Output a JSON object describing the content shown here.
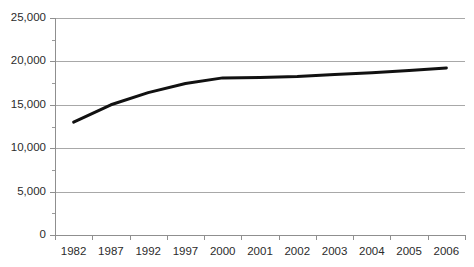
{
  "chart_data": {
    "type": "line",
    "title": "",
    "subtitle": "",
    "xlabel": "",
    "ylabel": "",
    "categories": [
      "1982",
      "1987",
      "1992",
      "1997",
      "2000",
      "2001",
      "2002",
      "2003",
      "2004",
      "2005",
      "2006"
    ],
    "series": [
      {
        "name": "",
        "values": [
          13000,
          15000,
          16400,
          17450,
          18100,
          18150,
          18250,
          18500,
          18700,
          18950,
          19250
        ]
      }
    ],
    "ylim": [
      0,
      25000
    ],
    "y_ticks": [
      0,
      5000,
      10000,
      15000,
      20000,
      25000
    ],
    "y_tick_labels": [
      "0",
      "5,000",
      "10,000",
      "15,000",
      "20,000",
      "25,000"
    ],
    "y_minor_tick_step": 2500,
    "grid": true,
    "grid_axis": "y",
    "legend": false,
    "legend_position": "none",
    "colors": {
      "series_line": "#111111",
      "gridline": "#a8a8a8",
      "axis": "#8f8f8f",
      "text": "#2b2b2b",
      "background": "#ffffff"
    }
  }
}
